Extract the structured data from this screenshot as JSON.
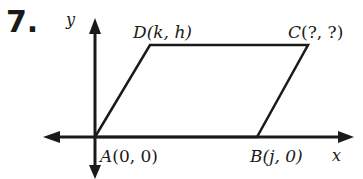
{
  "problem_number": "7.",
  "axes": {
    "x_label": "x",
    "y_label": "y"
  },
  "points": {
    "A": {
      "name": "A",
      "coords": "(0, 0)"
    },
    "B": {
      "name": "B",
      "coords": "(j, 0)"
    },
    "C": {
      "name": "C",
      "coords": "(?, ?)"
    },
    "D": {
      "name": "D",
      "coords": "(k, h)"
    }
  },
  "figure": "parallelogram ABCD",
  "colors": {
    "ink": "#1a1a1a",
    "background": "#ffffff"
  }
}
